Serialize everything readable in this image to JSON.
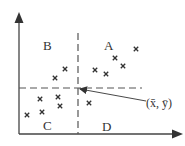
{
  "diagram": {
    "title": "",
    "colors": {
      "ink": "#333333",
      "axis": "#444444",
      "dash": "#555555",
      "background": "#ffffff"
    },
    "axes": {
      "origin": [
        19,
        134
      ],
      "x_end": [
        183,
        134
      ],
      "y_end": [
        19,
        12
      ]
    },
    "mean_point": {
      "x": 78,
      "y": 88,
      "label": "(x̄, ȳ)",
      "label_pos": [
        146,
        107
      ]
    },
    "dashed_lines": {
      "vertical": {
        "x": 78,
        "y1": 33,
        "y2": 134
      },
      "horizontal": {
        "y": 88,
        "x1": 19,
        "x2": 142
      }
    },
    "quadrants": [
      {
        "id": "A",
        "label": "A",
        "pos": [
          104,
          50
        ]
      },
      {
        "id": "B",
        "label": "B",
        "pos": [
          43,
          50
        ]
      },
      {
        "id": "C",
        "label": "C",
        "pos": [
          43,
          130
        ]
      },
      {
        "id": "D",
        "label": "D",
        "pos": [
          102,
          131
        ]
      }
    ],
    "points": [
      {
        "quadrant": "A",
        "x": 136,
        "y": 49
      },
      {
        "quadrant": "A",
        "x": 115,
        "y": 58
      },
      {
        "quadrant": "A",
        "x": 123,
        "y": 66
      },
      {
        "quadrant": "A",
        "x": 95,
        "y": 70
      },
      {
        "quadrant": "A",
        "x": 106,
        "y": 74
      },
      {
        "quadrant": "B",
        "x": 65,
        "y": 69
      },
      {
        "quadrant": "B",
        "x": 55,
        "y": 78
      },
      {
        "quadrant": "C",
        "x": 40,
        "y": 99
      },
      {
        "quadrant": "C",
        "x": 58,
        "y": 97
      },
      {
        "quadrant": "C",
        "x": 60,
        "y": 106
      },
      {
        "quadrant": "C",
        "x": 42,
        "y": 112
      },
      {
        "quadrant": "C",
        "x": 27,
        "y": 115
      },
      {
        "quadrant": "D",
        "x": 89,
        "y": 103
      }
    ],
    "marker_icon": "cross-marker-icon",
    "pointer": {
      "from": [
        146,
        101
      ],
      "to": [
        80,
        89
      ]
    }
  }
}
